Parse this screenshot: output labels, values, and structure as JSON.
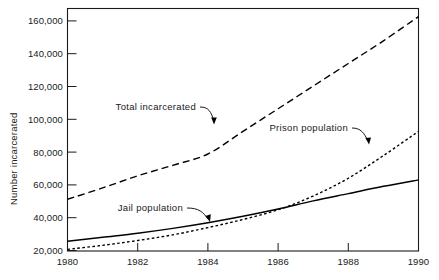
{
  "chart_data": {
    "type": "line",
    "title": "",
    "xlabel": "",
    "ylabel": "Number incarcerated",
    "xlim": [
      1980,
      1990
    ],
    "ylim": [
      20000,
      170000
    ],
    "grid": false,
    "legend_position": "inline-annotations",
    "x_ticks": [
      "1980",
      "1982",
      "1984",
      "1986",
      "1988",
      "1990"
    ],
    "x_tick_values": [
      1980,
      1982,
      1984,
      1986,
      1988,
      1990
    ],
    "y_ticks": [
      "20,000",
      "40,000",
      "60,000",
      "80,000",
      "100,000",
      "120,000",
      "140,000",
      "160,000"
    ],
    "y_tick_values": [
      20000,
      40000,
      60000,
      80000,
      100000,
      120000,
      140000,
      160000
    ],
    "x": [
      1980,
      1981,
      1982,
      1983,
      1984,
      1985,
      1986,
      1987,
      1988,
      1989,
      1990
    ],
    "series": [
      {
        "name": "Total incarcerated",
        "style": "dashed",
        "values": [
          52000,
          59000,
          66500,
          73000,
          80000,
          94000,
          108000,
          122000,
          136000,
          150000,
          165000
        ]
      },
      {
        "name": "Prison population",
        "style": "dotted",
        "values": [
          21000,
          23500,
          26500,
          30000,
          34500,
          39500,
          45500,
          54000,
          65000,
          79000,
          94000
        ]
      },
      {
        "name": "Jail population",
        "style": "solid",
        "values": [
          26000,
          28500,
          31000,
          34000,
          37500,
          41500,
          46000,
          51000,
          55500,
          60000,
          64000
        ]
      }
    ],
    "annotations": [
      {
        "label": "Total incarcerated",
        "series": "Total incarcerated"
      },
      {
        "label": "Prison population",
        "series": "Prison population"
      },
      {
        "label": "Jail population",
        "series": "Jail population"
      }
    ]
  },
  "colors": {
    "background": "#ffffff",
    "ink": "#1a1a1a",
    "line": "#000000"
  }
}
